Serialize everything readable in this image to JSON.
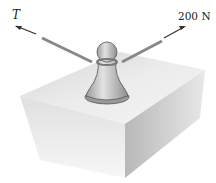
{
  "figure": {
    "labels": {
      "left_force": "T",
      "right_force": "200 N"
    },
    "elements": [
      "block",
      "bollard-post",
      "rope-left",
      "rope-right",
      "arrow-left",
      "arrow-right"
    ],
    "colors": {
      "block_top": "#e6e6e6",
      "block_left": "#d0d0d0",
      "block_right": "#bdbdbd",
      "post": "#c8c8c8",
      "rope": "#8a8a8a",
      "text": "#222222"
    }
  }
}
